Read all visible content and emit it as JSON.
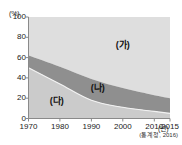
{
  "chart_data": {
    "type": "area",
    "stacked": true,
    "title": "",
    "subtitle": "",
    "xlabel": "(년)",
    "ylabel": "(%)",
    "x": [
      1970,
      1980,
      1990,
      2000,
      2010,
      2015
    ],
    "xlim": [
      1970,
      2015
    ],
    "ylim": [
      0,
      100
    ],
    "grid": false,
    "legend_position": "inline-annotations",
    "y_ticks": [
      0,
      20,
      40,
      60,
      80,
      100
    ],
    "y_tick_labels": [
      "0",
      "20",
      "40",
      "60",
      "80",
      "100"
    ],
    "x_ticks": [
      1970,
      1980,
      1990,
      2000,
      2010,
      2015
    ],
    "x_tick_labels": [
      "1970",
      "1980",
      "1990",
      "2000",
      "2010",
      "2015"
    ],
    "series": [
      {
        "name": "(다)",
        "label": "(다)",
        "color": "#cbcbcb",
        "stack_order": 1,
        "values": [
          50,
          34,
          18,
          11,
          7,
          5
        ]
      },
      {
        "name": "(나)",
        "label": "(나)",
        "color": "#8f8f8f",
        "stack_order": 2,
        "values": [
          12,
          17,
          21,
          19,
          16,
          15
        ]
      },
      {
        "name": "(가)",
        "label": "(가)",
        "color": "#dedede",
        "stack_order": 3,
        "values": [
          38,
          49,
          61,
          70,
          77,
          80
        ]
      }
    ],
    "cumulative_boundaries": {
      "lower_band_top": [
        50,
        34,
        18,
        11,
        7,
        5
      ],
      "middle_band_top": [
        62,
        51,
        39,
        30,
        23,
        20
      ]
    },
    "annotations": [
      {
        "text": "(가)",
        "x": 2000,
        "y": 72
      },
      {
        "text": "(나)",
        "x": 1992,
        "y": 30
      },
      {
        "text": "(다)",
        "x": 1979,
        "y": 17
      }
    ],
    "source": "(통계청, 2016)"
  },
  "axes": {
    "y_unit": "(%)",
    "x_unit": "(년)",
    "axis_color": "#888888"
  },
  "colors": {
    "band_top": "#dedede",
    "band_middle": "#8f8f8f",
    "band_bottom": "#cbcbcb",
    "axis": "#8a8a8a",
    "text": "#1a1a1a",
    "background": "#ffffff"
  }
}
